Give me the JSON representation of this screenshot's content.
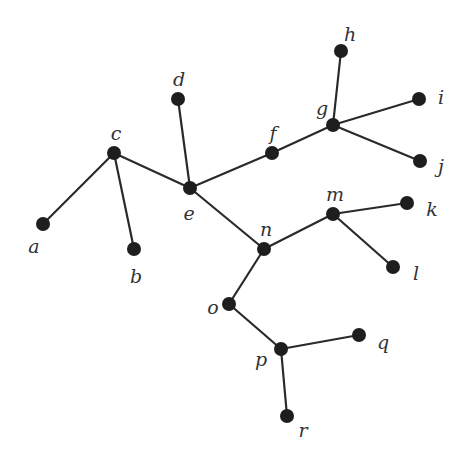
{
  "diagram": {
    "type": "tree-graph",
    "nodes": [
      {
        "id": "a",
        "label": "a",
        "x": 43,
        "y": 224,
        "lx": 34,
        "ly": 253
      },
      {
        "id": "b",
        "label": "b",
        "x": 134,
        "y": 249,
        "lx": 136,
        "ly": 283
      },
      {
        "id": "c",
        "label": "c",
        "x": 114,
        "y": 153,
        "lx": 116,
        "ly": 140
      },
      {
        "id": "d",
        "label": "d",
        "x": 178,
        "y": 99,
        "lx": 179,
        "ly": 86
      },
      {
        "id": "e",
        "label": "e",
        "x": 190,
        "y": 188,
        "lx": 189,
        "ly": 220
      },
      {
        "id": "f",
        "label": "f",
        "x": 272,
        "y": 153,
        "lx": 273,
        "ly": 140
      },
      {
        "id": "g",
        "label": "g",
        "x": 333,
        "y": 125,
        "lx": 322,
        "ly": 115
      },
      {
        "id": "h",
        "label": "h",
        "x": 341,
        "y": 51,
        "lx": 350,
        "ly": 41
      },
      {
        "id": "i",
        "label": "i",
        "x": 419,
        "y": 99,
        "lx": 441,
        "ly": 104
      },
      {
        "id": "j",
        "label": "j",
        "x": 420,
        "y": 161,
        "lx": 441,
        "ly": 173
      },
      {
        "id": "k",
        "label": "k",
        "x": 407,
        "y": 203,
        "lx": 432,
        "ly": 216
      },
      {
        "id": "l",
        "label": "l",
        "x": 393,
        "y": 267,
        "lx": 416,
        "ly": 280
      },
      {
        "id": "m",
        "label": "m",
        "x": 333,
        "y": 214,
        "lx": 335,
        "ly": 201
      },
      {
        "id": "n",
        "label": "n",
        "x": 264,
        "y": 249,
        "lx": 266,
        "ly": 236
      },
      {
        "id": "o",
        "label": "o",
        "x": 229,
        "y": 304,
        "lx": 213,
        "ly": 314
      },
      {
        "id": "p",
        "label": "p",
        "x": 281,
        "y": 349,
        "lx": 261,
        "ly": 366
      },
      {
        "id": "q",
        "label": "q",
        "x": 359,
        "y": 335,
        "lx": 383,
        "ly": 349
      },
      {
        "id": "r",
        "label": "r",
        "x": 287,
        "y": 416,
        "lx": 303,
        "ly": 437
      }
    ],
    "edges": [
      [
        "c",
        "a"
      ],
      [
        "c",
        "b"
      ],
      [
        "c",
        "e"
      ],
      [
        "d",
        "e"
      ],
      [
        "e",
        "f"
      ],
      [
        "f",
        "g"
      ],
      [
        "g",
        "h"
      ],
      [
        "g",
        "i"
      ],
      [
        "g",
        "j"
      ],
      [
        "e",
        "n"
      ],
      [
        "n",
        "m"
      ],
      [
        "m",
        "k"
      ],
      [
        "m",
        "l"
      ],
      [
        "n",
        "o"
      ],
      [
        "o",
        "p"
      ],
      [
        "p",
        "q"
      ],
      [
        "p",
        "r"
      ]
    ],
    "colors": {
      "node": "#1e1e1e",
      "edge": "#2a2a2a",
      "label": "#333333",
      "background": "#ffffff"
    }
  }
}
